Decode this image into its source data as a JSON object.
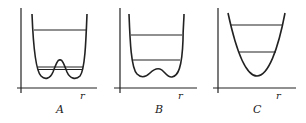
{
  "figure": {
    "panels": [
      {
        "id": "A",
        "label": "A",
        "axis_label": "r",
        "description": "double-well potential with high central barrier; two nearly degenerate low levels below barrier and one level above"
      },
      {
        "id": "B",
        "label": "B",
        "axis_label": "r",
        "description": "double-well potential with low central barrier; levels above barrier"
      },
      {
        "id": "C",
        "label": "C",
        "axis_label": "r",
        "description": "single-well harmonic-like potential with two levels"
      }
    ],
    "colors": {
      "line": "#222222",
      "background": "#ffffff"
    }
  }
}
